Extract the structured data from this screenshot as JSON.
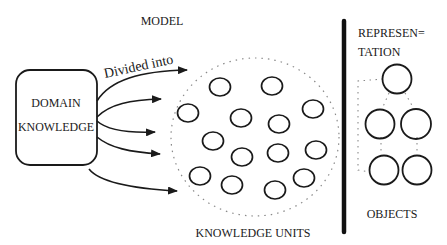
{
  "diagram": {
    "model_label": "MODEL",
    "domain_box": {
      "line1": "DOMAIN",
      "line2": "KNOWLEDGE"
    },
    "arrow_label": "Divided into",
    "knowledge_units_label": "KNOWLEDGE UNITS",
    "representation_label": {
      "line1": "REPRESEN=",
      "line2": "TATION"
    },
    "objects_label": "OBJECTS",
    "knowledge_unit_count": 14,
    "object_count": 5,
    "arrow_count": 5,
    "colors": {
      "ink": "#1a1a1a",
      "dots": "#8a8a8a",
      "background": "#ffffff"
    }
  }
}
